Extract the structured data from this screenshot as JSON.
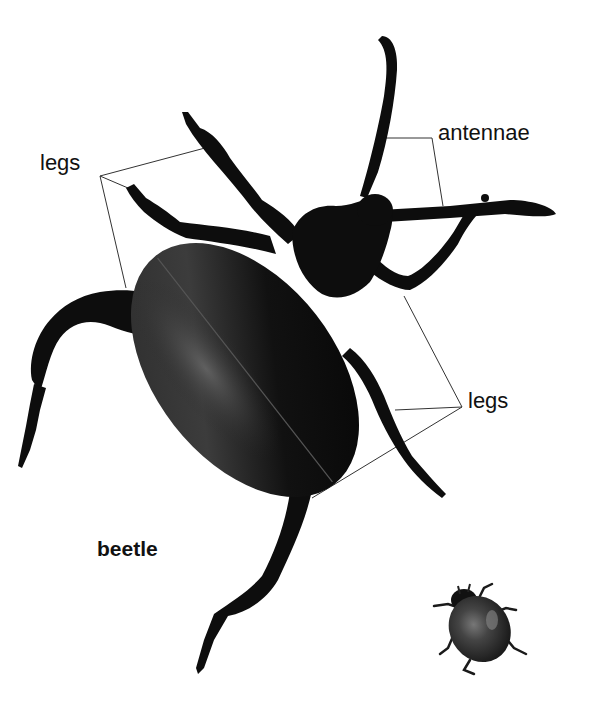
{
  "diagram": {
    "subject": "beetle",
    "labels": {
      "legs_left": "legs",
      "antennae": "antennae",
      "legs_right": "legs",
      "title": "beetle"
    },
    "images": [
      {
        "name": "large-beetle",
        "description": "Large black leaf beetle viewed from above, diagonal orientation"
      },
      {
        "name": "ladybird",
        "description": "Small dark ladybird beetle in lower-right"
      }
    ],
    "colors": {
      "background": "#ffffff",
      "beetle_body": "#0d0d0d",
      "highlight": "#4a4a4a",
      "leader_line": "#333333",
      "text": "#111111",
      "ladybird_shell": "#3a3a3a"
    }
  }
}
